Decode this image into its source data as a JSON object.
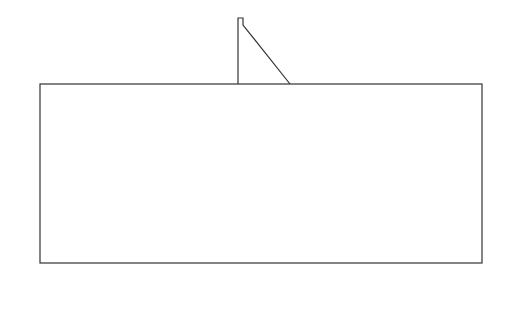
{
  "figure": {
    "caption": "(a) Mesh of the foundation",
    "line_color": "#333333",
    "top_nodes": [
      {
        "label": "84",
        "x": 32
      },
      {
        "label": "85",
        "x": 69
      },
      {
        "label": "86",
        "x": 97
      },
      {
        "label": "87",
        "x": 126
      },
      {
        "label": "88",
        "x": 153
      },
      {
        "label": "89",
        "x": 181
      },
      {
        "label": "90",
        "x": 210
      },
      {
        "label": "91",
        "x": 227
      },
      {
        "label": "49",
        "x": 301
      },
      {
        "label": "50",
        "x": 318
      },
      {
        "label": "51",
        "x": 346
      },
      {
        "label": "52",
        "x": 373
      },
      {
        "label": "53",
        "x": 401
      },
      {
        "label": "54",
        "x": 425
      },
      {
        "label": "55",
        "x": 452
      },
      {
        "label": "56",
        "x": 477
      }
    ],
    "left_nodes": [
      {
        "label": "83",
        "y": 117
      },
      {
        "label": "82",
        "y": 148
      },
      {
        "label": "81",
        "y": 177
      },
      {
        "label": "80",
        "y": 207
      },
      {
        "label": "79",
        "y": 237
      },
      {
        "label": "78",
        "y": 263
      }
    ],
    "right_nodes": [
      {
        "label": "57",
        "y": 117
      },
      {
        "label": "58",
        "y": 148
      },
      {
        "label": "59",
        "y": 177
      },
      {
        "label": "60",
        "y": 207
      },
      {
        "label": "61",
        "y": 237
      },
      {
        "label": "62",
        "y": 262
      }
    ],
    "bottom_nodes": [
      {
        "label": "77",
        "x": 71
      },
      {
        "label": "76",
        "x": 99
      },
      {
        "label": "75",
        "x": 126
      },
      {
        "label": "74",
        "x": 154
      },
      {
        "label": "73",
        "x": 181
      },
      {
        "label": "72",
        "x": 210
      },
      {
        "label": "71",
        "x": 238
      },
      {
        "label": "70",
        "x": 265
      },
      {
        "label": "69",
        "x": 293
      },
      {
        "label": "68",
        "x": 320
      },
      {
        "label": "67",
        "x": 348
      },
      {
        "label": "66",
        "x": 375
      },
      {
        "label": "65",
        "x": 403
      },
      {
        "label": "64",
        "x": 429
      },
      {
        "label": "63",
        "x": 455
      }
    ],
    "support_x": [
      40,
      70,
      98,
      126,
      154,
      181,
      210,
      238,
      265,
      293,
      320,
      348,
      375,
      403,
      430,
      456,
      482
    ],
    "roller_y": [
      84,
      115,
      146,
      175,
      205,
      235
    ]
  }
}
